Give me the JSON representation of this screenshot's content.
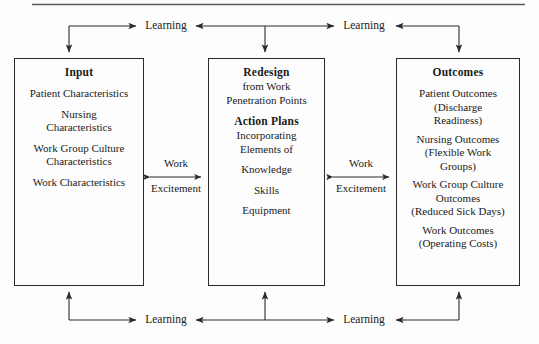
{
  "figure": {
    "title_rule": "horizontal-rule",
    "background": "#fdfdfd",
    "line_color": "#2b2b2b"
  },
  "boxes": {
    "input": {
      "title": "Input",
      "items": [
        "Patient Characteristics",
        "Nursing\nCharacteristics",
        "Work Group Culture\nCharacteristics",
        "Work Characteristics"
      ],
      "item1": "Patient Characteristics",
      "item2_line1": "Nursing",
      "item2_line2": "Characteristics",
      "item3_line1": "Work Group Culture",
      "item3_line2": "Characteristics",
      "item4": "Work Characteristics"
    },
    "redesign": {
      "title": "Redesign",
      "subtitle_line1": "from Work",
      "subtitle_line2": "Penetration Points",
      "subheading": "Action Plans",
      "sub_line1": "Incorporating",
      "sub_line2": "Elements of",
      "item1": "Knowledge",
      "item2": "Skills",
      "item3": "Equipment"
    },
    "outcomes": {
      "title": "Outcomes",
      "item1_line1": "Patient Outcomes",
      "item1_line2": "(Discharge",
      "item1_line3": "Readiness)",
      "item2_line1": "Nursing Outcomes",
      "item2_line2": "(Flexible Work",
      "item2_line3": "Groups)",
      "item3_line1": "Work Group Culture",
      "item3_line2": "Outcomes",
      "item3_line3": "(Reduced Sick Days)",
      "item4_line1": "Work Outcomes",
      "item4_line2": "(Operating Costs)"
    }
  },
  "edges": {
    "learning_top_left": "Learning",
    "learning_top_right": "Learning",
    "learning_bottom_left": "Learning",
    "learning_bottom_right": "Learning",
    "work_left_top": "Work",
    "work_left_bottom": "Excitement",
    "work_right_top": "Work",
    "work_right_bottom": "Excitement"
  }
}
